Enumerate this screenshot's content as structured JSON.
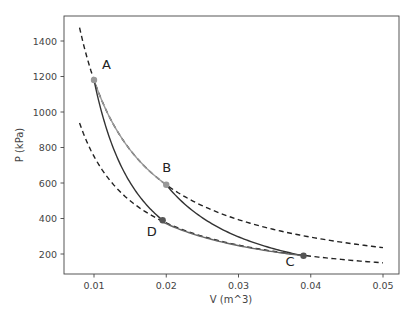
{
  "chart_data": {
    "type": "line",
    "title": "",
    "xlabel": "V (m^3)",
    "ylabel": "P (kPa)",
    "xlim": [
      0.0065,
      0.0522
    ],
    "ylim": [
      86,
      1540
    ],
    "grid": false,
    "legend": null,
    "x_ticks": [
      0.01,
      0.02,
      0.03,
      0.04,
      0.05
    ],
    "x_tick_labels": [
      "0.01",
      "0.02",
      "0.03",
      "0.04",
      "0.05"
    ],
    "y_ticks": [
      200,
      400,
      600,
      800,
      1000,
      1200,
      1400
    ],
    "y_tick_labels": [
      "200",
      "400",
      "600",
      "800",
      "1000",
      "1200",
      "1400"
    ],
    "points": [
      {
        "label": "A",
        "V": 0.01,
        "P": 1180,
        "color": "#999999"
      },
      {
        "label": "B",
        "V": 0.02,
        "P": 590,
        "color": "#999999"
      },
      {
        "label": "C",
        "V": 0.039,
        "P": 190,
        "color": "#555555"
      },
      {
        "label": "D",
        "V": 0.0195,
        "P": 390,
        "color": "#555555"
      }
    ],
    "series": [
      {
        "name": "isotherm-hot (dashed)",
        "style": "dashed",
        "color": "#222222",
        "PV_const": 11.8,
        "V_range": [
          0.008,
          0.05
        ]
      },
      {
        "name": "isotherm-cold (dashed)",
        "style": "dashed",
        "color": "#222222",
        "PV_const": 7.5,
        "V_range": [
          0.008,
          0.05
        ]
      },
      {
        "name": "A-B isothermal expansion",
        "style": "solid",
        "color": "#999999",
        "from": "A",
        "to": "B"
      },
      {
        "name": "B-C adiabatic expansion",
        "style": "solid",
        "color": "#333333",
        "from": "B",
        "to": "C"
      },
      {
        "name": "C-D isothermal compression",
        "style": "solid",
        "color": "#666666",
        "from": "C",
        "to": "D"
      },
      {
        "name": "D-A adiabatic compression",
        "style": "solid",
        "color": "#333333",
        "from": "D",
        "to": "A"
      }
    ]
  }
}
